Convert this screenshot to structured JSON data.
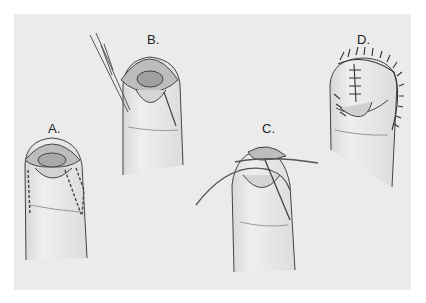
{
  "figure": {
    "background_color": "#ebebeb",
    "panels": [
      {
        "id": "A",
        "label": "A."
      },
      {
        "id": "B",
        "label": "B."
      },
      {
        "id": "C",
        "label": "C."
      },
      {
        "id": "D",
        "label": "D."
      }
    ]
  }
}
